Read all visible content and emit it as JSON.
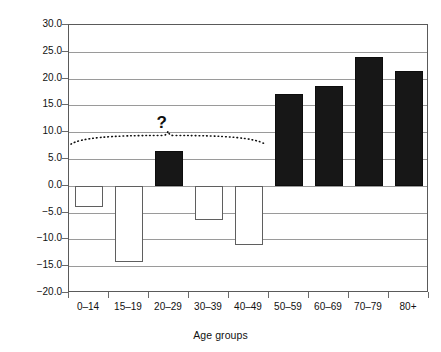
{
  "chart_data": {
    "type": "bar",
    "title": "",
    "xlabel": "Age groups",
    "ylabel": "Percentage increase or decrease",
    "categories": [
      "0–14",
      "15–19",
      "20–29",
      "30–39",
      "40–49",
      "50–59",
      "60–69",
      "70–79",
      "80+"
    ],
    "values": [
      -4.0,
      -14.3,
      6.4,
      -6.4,
      -11.0,
      17.2,
      18.7,
      24.1,
      21.4
    ],
    "bar_styles": [
      "open",
      "open",
      "filled",
      "open",
      "open",
      "filled",
      "filled",
      "filled",
      "filled"
    ],
    "ylim": [
      -20.0,
      30.0
    ],
    "ytick_labels": [
      "30.0",
      "25.0",
      "20.0",
      "15.0",
      "10.0",
      "5.0",
      "0.0",
      "−5.0",
      "−10.0",
      "−15.0",
      "−20.0"
    ],
    "ytick_values": [
      30.0,
      25.0,
      20.0,
      15.0,
      10.0,
      5.0,
      0.0,
      -5.0,
      -10.0,
      -15.0,
      -20.0
    ],
    "grid": true,
    "legend": "none",
    "annotations": [
      {
        "name": "question-mark",
        "text": "?",
        "x_center_pct": 26.0,
        "y_value": 11.5
      },
      {
        "name": "dotted-brace",
        "text": "",
        "span_categories": [
          "0–14",
          "40–49"
        ],
        "y_value": 7.6
      }
    ],
    "colors": {
      "filled_bar": "#171717",
      "open_bar_fill": "#ffffff",
      "open_bar_stroke": "#5f5f5f",
      "gridline": "#9a9a9a",
      "axis": "#5a5a5a",
      "text": "#111111"
    }
  }
}
